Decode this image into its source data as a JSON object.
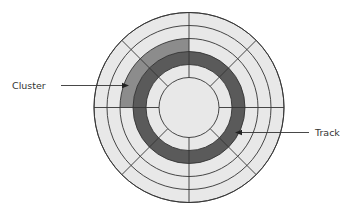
{
  "diagram": {
    "center": [
      189,
      107.5
    ],
    "ring_radii": [
      95,
      82,
      69,
      56,
      43,
      30
    ],
    "sector_angles_deg": [
      0,
      45,
      90,
      135,
      180,
      225,
      270,
      315
    ],
    "colors": {
      "background": "#ffffff",
      "platter_fill": "#e8e8e8",
      "track_fill": "#5a5a5a",
      "cluster_fill": "#8c8c8c",
      "stroke": "#333333"
    },
    "track": {
      "inner_radius": 43,
      "outer_radius": 56
    },
    "cluster": {
      "inner_radius": 56,
      "outer_radius": 69,
      "start_angle_deg": 180,
      "end_angle_deg": 270
    },
    "labels": {
      "cluster": "Cluster",
      "track": "Track"
    }
  }
}
